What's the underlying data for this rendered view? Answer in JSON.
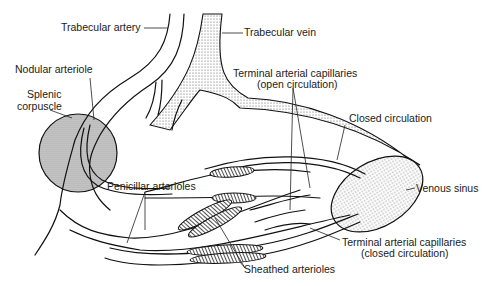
{
  "labels": {
    "trabecular_artery": "Trabecular artery",
    "trabecular_vein": "Trabecular vein",
    "nodular_arteriole": "Nodular arteriole",
    "splenic_corpuscle_1": "Splenic",
    "splenic_corpuscle_2": "corpuscle",
    "terminal_open_1": "Terminal arterial capillaries",
    "terminal_open_2": "(open circulation)",
    "closed_circulation": "Closed circulation",
    "penicillar_arterioles": "Penicillar arterioles",
    "venous_sinus": "Venous sinus",
    "terminal_closed_1": "Terminal arterial capillaries",
    "terminal_closed_2": "(closed circulation)",
    "sheathed_arterioles": "Sheathed arterioles"
  },
  "colors": {
    "line": "#111111",
    "stipple": "#555555",
    "sheath": "#333333"
  }
}
